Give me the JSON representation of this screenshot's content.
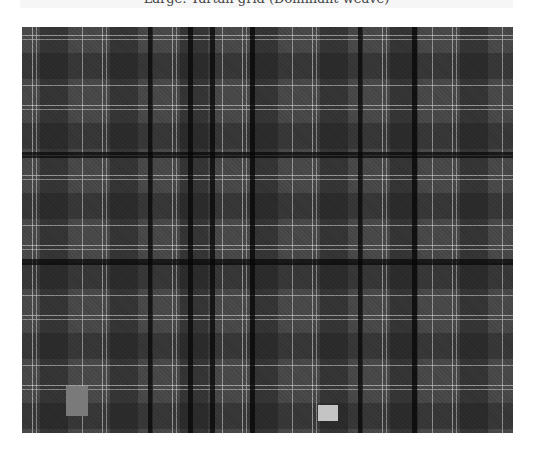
{
  "caption": "Large: Tartan grid (Dominant weave)",
  "pattern": {
    "name": "tartan-plaid",
    "base_color": "#4a4a4a",
    "stripe_color": "#e6e6e6",
    "dark_band_color": "#050505",
    "dark_vertical_bands_x": [
      126,
      166,
      188,
      228,
      336,
      390
    ],
    "dark_horizontal_bands_y": [
      125,
      232
    ]
  },
  "swatches": [
    {
      "label": "",
      "color": "#7a7a7a",
      "x": 44,
      "y": 359,
      "w": 22,
      "h": 30
    },
    {
      "label": "",
      "color": "#c4c4c4",
      "x": 296,
      "y": 378,
      "w": 20,
      "h": 16
    }
  ]
}
